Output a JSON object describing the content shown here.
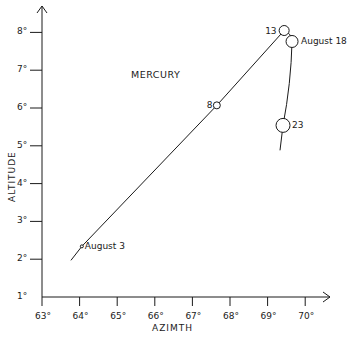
{
  "chart_data": {
    "type": "line",
    "title": "MERCURY",
    "xlabel": "AZIMTH",
    "ylabel": "ALTITUDE",
    "xlim": [
      63,
      70.7
    ],
    "ylim": [
      1,
      8.4
    ],
    "grid": false,
    "legend": null,
    "x_ticks": [
      63,
      64,
      65,
      66,
      67,
      68,
      69,
      70
    ],
    "x_tick_labels": [
      "63°",
      "64°",
      "65°",
      "66°",
      "67°",
      "68°",
      "69°",
      "70°"
    ],
    "y_ticks": [
      1,
      2,
      3,
      4,
      5,
      6,
      7,
      8
    ],
    "y_tick_labels": [
      "1°",
      "2°",
      "3°",
      "4°",
      "5°",
      "6°",
      "7°",
      "8°"
    ],
    "series": [
      {
        "name": "Mercury path",
        "path": [
          {
            "x": 63.77,
            "y": 1.97
          },
          {
            "x": 64.06,
            "y": 2.34
          },
          {
            "x": 67.65,
            "y": 6.07
          },
          {
            "x": 69.44,
            "y": 8.05
          },
          {
            "x": 69.62,
            "y": 8.0
          },
          {
            "x": 69.65,
            "y": 7.76
          },
          {
            "x": 69.41,
            "y": 5.54
          },
          {
            "x": 69.33,
            "y": 4.88
          }
        ],
        "points": [
          {
            "label": "August 3",
            "x": 64.06,
            "y": 2.34,
            "marker_size": 1.5
          },
          {
            "label": "8",
            "x": 67.65,
            "y": 6.07,
            "marker_size": 3.5
          },
          {
            "label": "13",
            "x": 69.44,
            "y": 8.05,
            "marker_size": 5
          },
          {
            "label": "August 18",
            "x": 69.65,
            "y": 7.76,
            "marker_size": 6
          },
          {
            "label": "23",
            "x": 69.41,
            "y": 5.54,
            "marker_size": 7
          }
        ]
      }
    ]
  }
}
